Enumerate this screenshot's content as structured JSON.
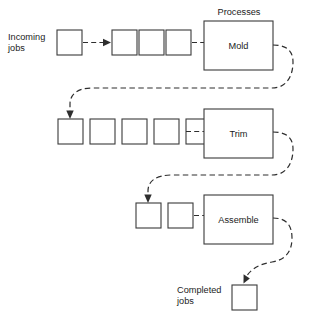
{
  "diagram": {
    "header": {
      "label": "Processes",
      "x": 239,
      "y": 15
    },
    "colors": {
      "background": "#ffffff",
      "line": "#2e2e2e",
      "box_stroke": "#3a3a3a",
      "text": "#1c1c1c"
    },
    "labels": {
      "incoming_line1": "Incoming",
      "incoming_line2": "jobs",
      "completed_line1": "Completed",
      "completed_line2": "jobs"
    },
    "stages": [
      {
        "name": "Mold",
        "process_label": "Mold",
        "box": {
          "x": 204,
          "y": 21,
          "width": 69,
          "height": 49
        },
        "queue_count": 3,
        "arrival_count": 1
      },
      {
        "name": "Trim",
        "process_label": "Trim",
        "box": {
          "x": 204,
          "y": 109,
          "width": 69,
          "height": 49
        },
        "queue_count": 5,
        "arrival_count": 0
      },
      {
        "name": "Assemble",
        "process_label": "Assemble",
        "box": {
          "x": 204,
          "y": 195,
          "width": 69,
          "height": 49
        },
        "queue_count": 2,
        "arrival_count": 0
      }
    ],
    "job_boxes": {
      "size": 25,
      "row1_arrival": [
        {
          "x": 57,
          "y": 30
        }
      ],
      "row1_queue": [
        {
          "x": 112,
          "y": 30
        },
        {
          "x": 139,
          "y": 30
        },
        {
          "x": 166,
          "y": 30
        }
      ],
      "row2_queue": [
        {
          "x": 58,
          "y": 119
        },
        {
          "x": 90,
          "y": 119
        },
        {
          "x": 122,
          "y": 119
        },
        {
          "x": 154,
          "y": 119
        },
        {
          "x": 186,
          "y": 119
        }
      ],
      "row3_queue": [
        {
          "x": 136,
          "y": 203
        },
        {
          "x": 168,
          "y": 203
        }
      ],
      "completed": {
        "x": 232,
        "y": 285
      }
    },
    "connectors": [
      {
        "name": "incoming-to-queue1",
        "kind": "straight-dashed-arrow"
      },
      {
        "name": "queue1-to-mold",
        "kind": "straight-dashed"
      },
      {
        "name": "mold-to-queue2",
        "kind": "curved-dashed-arrow"
      },
      {
        "name": "queue2-to-trim",
        "kind": "straight-dashed"
      },
      {
        "name": "trim-to-queue3",
        "kind": "curved-dashed-arrow"
      },
      {
        "name": "queue3-to-assemble",
        "kind": "straight-dashed"
      },
      {
        "name": "assemble-to-completed",
        "kind": "curved-dashed-arrow"
      }
    ]
  }
}
